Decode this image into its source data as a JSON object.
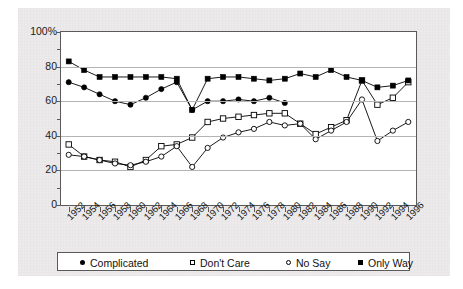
{
  "chart_data": {
    "type": "line",
    "title": "",
    "xlabel": "",
    "ylabel": "",
    "ylim": [
      0,
      100
    ],
    "ytick_labels": [
      "0",
      "20",
      "40",
      "60",
      "80",
      "100%"
    ],
    "ytick_values": [
      0,
      20,
      40,
      60,
      80,
      100
    ],
    "yminor_values": [
      10,
      30,
      50,
      70,
      90
    ],
    "grid": true,
    "legend_position": "bottom",
    "x": [
      1952,
      1954,
      1956,
      1958,
      1960,
      1962,
      1964,
      1966,
      1968,
      1970,
      1972,
      1974,
      1976,
      1978,
      1980,
      1982,
      1984,
      1986,
      1988,
      1990,
      1992,
      1994,
      1996
    ],
    "categories": [
      "1952",
      "1954",
      "1956",
      "1958",
      "1960",
      "1962",
      "1964",
      "1966",
      "1968",
      "1970",
      "1972",
      "1974",
      "1976",
      "1978",
      "1980",
      "1982",
      "1984",
      "1986",
      "1988",
      "1990",
      "1992",
      "1994",
      "1996"
    ],
    "series": [
      {
        "name": "Complicated",
        "marker": "filled-circle",
        "color": "#000000",
        "values": [
          71,
          68,
          64,
          60,
          58,
          62,
          67,
          71,
          55,
          60,
          60,
          61,
          60,
          62,
          59,
          null,
          null,
          null,
          null,
          null,
          null,
          null,
          null
        ]
      },
      {
        "name": "Don't Care",
        "marker": "open-square",
        "color": "#000000",
        "values": [
          35,
          28,
          26,
          25,
          22,
          26,
          34,
          35,
          39,
          48,
          50,
          51,
          52,
          53,
          53,
          47,
          41,
          45,
          49,
          72,
          58,
          62,
          71
        ]
      },
      {
        "name": "No Say",
        "marker": "open-circle",
        "color": "#000000",
        "values": [
          29,
          28,
          26,
          24,
          23,
          25,
          28,
          34,
          22,
          33,
          39,
          42,
          44,
          48,
          46,
          47,
          38,
          43,
          48,
          61,
          37,
          43,
          48
        ]
      },
      {
        "name": "Only Way",
        "marker": "filled-square",
        "color": "#000000",
        "values": [
          83,
          78,
          74,
          74,
          74,
          74,
          74,
          73,
          55,
          73,
          74,
          74,
          73,
          72,
          73,
          76,
          74,
          78,
          74,
          72,
          68,
          69,
          72
        ]
      }
    ],
    "note": "Complicated series plotted 1952-1980; all series share the same 1952-1996 biennial x axis."
  },
  "legend": {
    "items": [
      {
        "label": "Complicated",
        "marker": "filled-circle"
      },
      {
        "label": "Don't Care",
        "marker": "open-square"
      },
      {
        "label": "No Say",
        "marker": "open-circle"
      },
      {
        "label": "Only Way",
        "marker": "filled-square"
      }
    ]
  }
}
